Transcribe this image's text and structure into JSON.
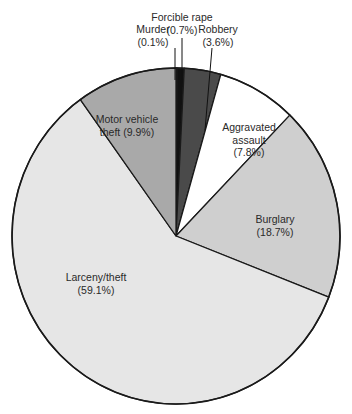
{
  "chart_data": {
    "type": "pie",
    "title": "",
    "start_angle_deg": 0,
    "direction": "clockwise",
    "slices": [
      {
        "label": "Murder",
        "value": 0.1,
        "pct_label": "(0.1%)",
        "color": "#b8b8b8"
      },
      {
        "label": "Forcible rape",
        "value": 0.7,
        "pct_label": "(0.7%)",
        "color": "#111111"
      },
      {
        "label": "Robbery",
        "value": 3.6,
        "pct_label": "(3.6%)",
        "color": "#4a4a4a"
      },
      {
        "label": "Aggravated assault",
        "value": 7.8,
        "pct_label": "(7.8%)",
        "color": "#ffffff"
      },
      {
        "label": "Burglary",
        "value": 18.7,
        "pct_label": "(18.7%)",
        "color": "#cfcfcf"
      },
      {
        "label": "Larceny/theft",
        "value": 59.1,
        "pct_label": "(59.1%)",
        "color": "#e6e6e6"
      },
      {
        "label": "Motor vehicle theft",
        "value": 9.9,
        "pct_label": "(9.9%)",
        "color": "#a9a9a9"
      }
    ]
  },
  "labels": {
    "murder": {
      "line1": "Murder",
      "line2": "(0.1%)"
    },
    "rape": {
      "line1": "Forcible rape",
      "line2": "(0.7%)"
    },
    "robbery": {
      "line1": "Robbery",
      "line2": "(3.6%)"
    },
    "assault": {
      "line1": "Aggravated",
      "line2": "assault",
      "line3": "(7.8%)"
    },
    "burglary": {
      "line1": "Burglary",
      "line2": "(18.7%)"
    },
    "larceny": {
      "line1": "Larceny/theft",
      "line2": "(59.1%)"
    },
    "motor": {
      "line1": "Motor vehicle",
      "line2": "theft (9.9%)"
    }
  }
}
